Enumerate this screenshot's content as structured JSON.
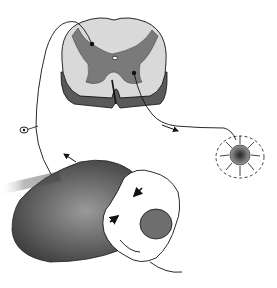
{
  "figure": {
    "type": "anatomical-illustration",
    "style": "grayscale line drawing",
    "colors": {
      "background": "#ffffff",
      "ink": "#111111",
      "gray_matter": "#7a7a7a",
      "white_matter": "#d9d9d9",
      "shadow": "#4a4a4a"
    },
    "elements": [
      {
        "name": "spinal-cord-cross-section",
        "description": "spinal cord segment with gray matter butterfly and central canal"
      },
      {
        "name": "afferent-nerve-path",
        "description": "sensory fiber curving from periphery into dorsal horn, with ganglion cell body"
      },
      {
        "name": "efferent-nerve-path",
        "description": "motor fiber exiting ventral horn toward target"
      },
      {
        "name": "target-cell-cluster",
        "description": "circular target with radiating arrows inside dashed boundary"
      },
      {
        "name": "lower-anatomy-region",
        "description": "shaded anatomical region with hand applying pressure, arrows indicating direction"
      }
    ]
  }
}
